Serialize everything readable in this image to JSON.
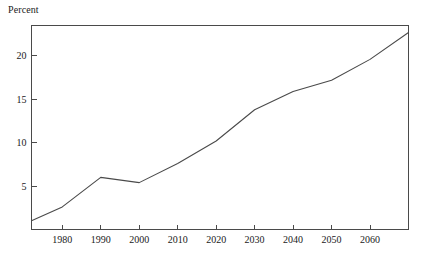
{
  "chart_data": {
    "type": "line",
    "title": "",
    "ylabel": "Percent",
    "xlabel": "",
    "x": [
      1972,
      1980,
      1990,
      2000,
      2010,
      2020,
      2030,
      2040,
      2050,
      2060,
      2070
    ],
    "values": [
      1.0,
      2.6,
      6.0,
      5.4,
      7.6,
      10.2,
      13.8,
      15.9,
      17.2,
      19.6,
      22.7
    ],
    "series": [
      {
        "name": "Percent",
        "values": [
          1.0,
          2.6,
          6.0,
          5.4,
          7.6,
          10.2,
          13.8,
          15.9,
          17.2,
          19.6,
          22.7
        ]
      }
    ],
    "xlim": [
      1972,
      2070
    ],
    "ylim": [
      0,
      23.5
    ],
    "xticks": [
      1980,
      1990,
      2000,
      2010,
      2020,
      2030,
      2040,
      2050,
      2060
    ],
    "xticklabels": [
      "1980",
      "1990",
      "2000",
      "2010",
      "2020",
      "2030",
      "2040",
      "2050",
      "2060"
    ],
    "yticks": [
      5,
      10,
      15,
      20
    ],
    "yticklabels": [
      "5",
      "10",
      "15",
      "20"
    ],
    "grid": false,
    "legend": null,
    "line_color": "#4a4a4a",
    "background_color": "#ffffff"
  },
  "axis": {
    "y_title": "Percent"
  }
}
